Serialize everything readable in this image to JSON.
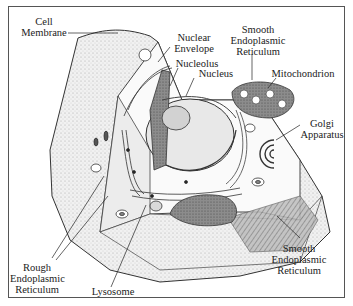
{
  "diagram": {
    "labels": {
      "cell_membrane": "Cell\nMembrane",
      "nuclear_envelope": "Nuclear\nEnvelope",
      "nucleolus": "Nucleolus",
      "nucleus": "Nucleus",
      "smooth_er_top": "Smooth\nEndoplasmic\nReticulum",
      "mitochondrion": "Mitochondrion",
      "golgi": "Golgi\nApparatus",
      "smooth_er_bottom": "Smooth\nEndoplasmic\nReticulum",
      "rough_er": "Rough\nEndoplasmic\nReticulum",
      "lysosome": "Lysosome"
    },
    "colors": {
      "line": "#222222",
      "shade_dark": "#6b6b6b",
      "shade_mid": "#a8a8a8",
      "shade_light": "#e4e4e4",
      "frame": "#555555"
    }
  }
}
